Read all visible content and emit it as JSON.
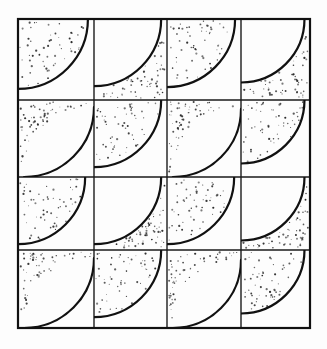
{
  "figure": {
    "type": "geometric-tiling-illustration",
    "style": "vintage engraving / stipple shading",
    "background_color": "#fdfdfd",
    "paper_color": "#ffffff",
    "ink_color": "#111111",
    "stipple_color": "#2a2a2a",
    "line_color": "#1a1a1a",
    "border": {
      "x": 18,
      "y": 19,
      "width": 292,
      "height": 309,
      "stroke_width": 2.2,
      "color": "#111111"
    },
    "grid": {
      "columns": 4,
      "rows": 4,
      "x_lines": [
        18,
        94,
        167,
        241,
        310
      ],
      "y_lines": [
        19,
        100,
        177,
        250,
        328
      ],
      "stroke_width": 1.4,
      "color": "#1a1a1a"
    },
    "arc": {
      "stroke_width": 2.2,
      "color": "#111111"
    },
    "stipple": {
      "dot_radius_min": 0.45,
      "dot_radius_max": 1.15,
      "density_per_tile": 56,
      "color": "#2b2b2b"
    },
    "tiles": [
      {
        "row": 0,
        "col": 0,
        "kind": "quarter",
        "corner": "tl",
        "shaded": "inside"
      },
      {
        "row": 0,
        "col": 1,
        "kind": "quarter",
        "corner": "tl",
        "shaded": "outside"
      },
      {
        "row": 0,
        "col": 2,
        "kind": "quarter",
        "corner": "tl",
        "shaded": "inside"
      },
      {
        "row": 0,
        "col": 3,
        "kind": "quarter",
        "corner": "tl",
        "shaded": "outside"
      },
      {
        "row": 1,
        "col": 0,
        "kind": "quarter",
        "corner": "br",
        "shaded": "outside"
      },
      {
        "row": 1,
        "col": 1,
        "kind": "quarter",
        "corner": "tl",
        "shaded": "inside"
      },
      {
        "row": 1,
        "col": 2,
        "kind": "quarter",
        "corner": "br",
        "shaded": "outside"
      },
      {
        "row": 1,
        "col": 3,
        "kind": "quarter",
        "corner": "tl",
        "shaded": "inside"
      },
      {
        "row": 2,
        "col": 0,
        "kind": "quarter",
        "corner": "tl",
        "shaded": "inside"
      },
      {
        "row": 2,
        "col": 1,
        "kind": "quarter",
        "corner": "tl",
        "shaded": "outside"
      },
      {
        "row": 2,
        "col": 2,
        "kind": "quarter",
        "corner": "tl",
        "shaded": "inside"
      },
      {
        "row": 2,
        "col": 3,
        "kind": "quarter",
        "corner": "tl",
        "shaded": "outside"
      },
      {
        "row": 3,
        "col": 0,
        "kind": "quarter",
        "corner": "br",
        "shaded": "outside"
      },
      {
        "row": 3,
        "col": 1,
        "kind": "quarter",
        "corner": "tl",
        "shaded": "inside"
      },
      {
        "row": 3,
        "col": 2,
        "kind": "quarter",
        "corner": "br",
        "shaded": "outside"
      },
      {
        "row": 3,
        "col": 3,
        "kind": "quarter",
        "corner": "tl",
        "shaded": "inside"
      }
    ],
    "caption": ""
  }
}
